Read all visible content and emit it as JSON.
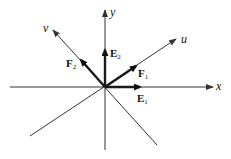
{
  "diagram": {
    "type": "coordinate-axes-with-basis-vectors",
    "origin": [
      105,
      87
    ],
    "axes": [
      {
        "name": "x",
        "label": "x",
        "from": [
          10,
          87
        ],
        "to": [
          213,
          87
        ],
        "arrow": true
      },
      {
        "name": "y",
        "label": "y",
        "from": [
          105,
          150
        ],
        "to": [
          105,
          10
        ],
        "arrow": true
      },
      {
        "name": "u",
        "label": "u",
        "from": [
          30,
          136
        ],
        "to": [
          176,
          39
        ],
        "arrow": true
      },
      {
        "name": "v",
        "label": "v",
        "from": [
          157,
          145
        ],
        "to": [
          53,
          30
        ],
        "arrow": true
      }
    ],
    "vectors": [
      {
        "name": "E1",
        "label": "E",
        "sub": "1",
        "from": [
          105,
          87
        ],
        "to": [
          140,
          87
        ]
      },
      {
        "name": "E2",
        "label": "E",
        "sub": "2",
        "from": [
          105,
          87
        ],
        "to": [
          105,
          50
        ]
      },
      {
        "name": "F1",
        "label": "F",
        "sub": "1",
        "from": [
          105,
          87
        ],
        "to": [
          136,
          66
        ]
      },
      {
        "name": "F2",
        "label": "F",
        "sub": "2",
        "from": [
          105,
          87
        ],
        "to": [
          81,
          60
        ]
      }
    ],
    "colors": {
      "line": "#333333",
      "vector": "#1a1a1a",
      "background": "#ffffff"
    }
  },
  "labels": {
    "x": "x",
    "y": "y",
    "u": "u",
    "v": "v",
    "E1": {
      "main": "E",
      "sub": "1"
    },
    "E2": {
      "main": "E",
      "sub": "2"
    },
    "F1": {
      "main": "F",
      "sub": "1"
    },
    "F2": {
      "main": "F",
      "sub": "2"
    }
  }
}
